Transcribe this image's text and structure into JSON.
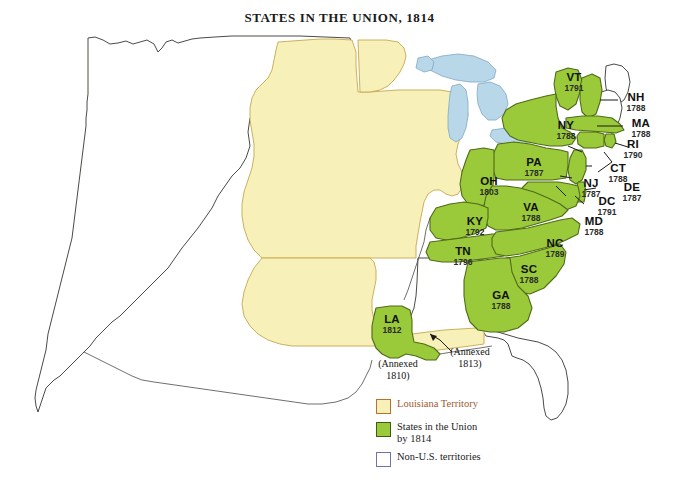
{
  "map": {
    "title": "STATES IN THE UNION, 1814",
    "year": "1814",
    "colors": {
      "louisiana_territory": "#f7f0b9",
      "states_in_union": "#9ac93a",
      "non_us_territories": "#ffffff",
      "water": "#b8d8ea",
      "outline": "#4a4a45",
      "state_border": "#4f6b18",
      "background": "#ffffff",
      "title_text": "#1a1a1a",
      "territory_label_text": "#a05a30"
    }
  },
  "states": [
    {
      "abbr": "VT",
      "year": "1791"
    },
    {
      "abbr": "NH",
      "year": "1788"
    },
    {
      "abbr": "MA",
      "year": "1788"
    },
    {
      "abbr": "RI",
      "year": "1790"
    },
    {
      "abbr": "CT",
      "year": "1788"
    },
    {
      "abbr": "NY",
      "year": "1788"
    },
    {
      "abbr": "PA",
      "year": "1787"
    },
    {
      "abbr": "NJ",
      "year": "1787"
    },
    {
      "abbr": "DE",
      "year": "1787"
    },
    {
      "abbr": "DC",
      "year": "1791"
    },
    {
      "abbr": "MD",
      "year": "1788"
    },
    {
      "abbr": "OH",
      "year": "1803"
    },
    {
      "abbr": "VA",
      "year": "1788"
    },
    {
      "abbr": "KY",
      "year": "1792"
    },
    {
      "abbr": "TN",
      "year": "1796"
    },
    {
      "abbr": "NC",
      "year": "1789"
    },
    {
      "abbr": "SC",
      "year": "1788"
    },
    {
      "abbr": "GA",
      "year": "1788"
    },
    {
      "abbr": "LA",
      "year": "1812"
    }
  ],
  "annotations": [
    {
      "id": "annexed-1810",
      "line1": "(Annexed",
      "line2": "1810)"
    },
    {
      "id": "annexed-1813",
      "line1": "(Annexed",
      "line2": "1813)"
    }
  ],
  "legend": {
    "items": [
      {
        "label": "Louisiana Territory",
        "label2": "",
        "swatch": "louisiana-territory-swatch"
      },
      {
        "label": "States in the Union",
        "label2": "by 1814",
        "swatch": "states-in-union-swatch"
      },
      {
        "label": "Non-U.S. territories",
        "label2": "",
        "swatch": "non-us-territories-swatch"
      }
    ]
  }
}
